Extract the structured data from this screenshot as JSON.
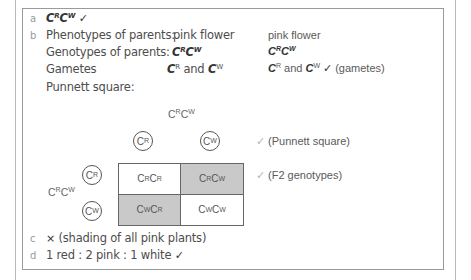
{
  "answers": {
    "a": {
      "label": "a",
      "genotype": [
        {
          "base": "C",
          "sup": "R"
        },
        {
          "base": "C",
          "sup": "W"
        }
      ],
      "tick": "✓"
    },
    "b": {
      "label": "b",
      "phenotypes_label": "Phenotypes of parents:",
      "phenotype_parent1": "pink flower",
      "phenotype_parent2": "pink flower",
      "genotypes_label": "Genotypes of parents:",
      "genotype_parent1": "CRCW",
      "genotype_parent2": "CRCW",
      "gametes_label": "Gametes",
      "gametes_parent1": "CR and CW",
      "gametes_parent2": "CR and CW",
      "gametes_tick": "✓",
      "gametes_note": "(gametes)",
      "and_word": "and",
      "punnett_label": "Punnett square:"
    },
    "punnett": {
      "top_parent": "CRCW",
      "left_parent": "CRCW",
      "top_gametes": [
        "R",
        "W"
      ],
      "left_gametes": [
        "R",
        "W"
      ],
      "cells": [
        {
          "a": "R",
          "b": "R",
          "shaded": false
        },
        {
          "a": "R",
          "b": "W",
          "shaded": true
        },
        {
          "a": "W",
          "b": "R",
          "shaded": true
        },
        {
          "a": "W",
          "b": "W",
          "shaded": false
        }
      ],
      "mark_punnett": "(Punnett square)",
      "mark_f2": "(F2 genotypes)",
      "faint_tick": "✓"
    },
    "c": {
      "label": "c",
      "cross": "×",
      "text": "(shading of all pink plants)"
    },
    "d": {
      "label": "d",
      "text": "1 red : 2 pink : 1 white",
      "tick": "✓"
    }
  },
  "colors": {
    "shaded_cell": "#c9c9c9",
    "border": "#9a9a9a"
  }
}
